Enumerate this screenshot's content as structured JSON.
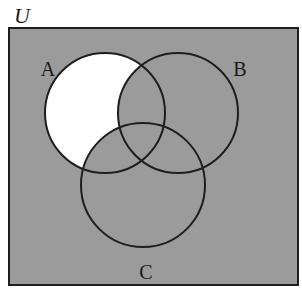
{
  "diagram": {
    "type": "venn",
    "universe": {
      "label": "U",
      "rect": {
        "x": 9,
        "y": 28,
        "width": 289,
        "height": 257
      }
    },
    "sets": [
      {
        "label": "A",
        "cx": 105,
        "cy": 113,
        "r": 60,
        "label_x": 48,
        "label_y": 74
      },
      {
        "label": "B",
        "cx": 178,
        "cy": 113,
        "r": 60,
        "label_x": 240,
        "label_y": 74
      },
      {
        "label": "C",
        "cx": 143,
        "cy": 185,
        "r": 62,
        "label_x": 146,
        "label_y": 280
      }
    ],
    "shading": {
      "unshaded_region": "A ∩ B' ∩ C'",
      "shaded_region": "U − (A ∩ B' ∩ C')"
    }
  },
  "colors": {
    "shade": "#9b9b9b",
    "unshaded": "#ffffff",
    "stroke": "#1e1e1e",
    "background": "#ffffff"
  }
}
